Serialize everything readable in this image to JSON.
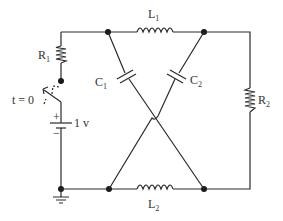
{
  "diagram": {
    "type": "circuit-schematic",
    "components": {
      "R1": {
        "label": "R",
        "sub": "1"
      },
      "R2": {
        "label": "R",
        "sub": "2"
      },
      "L1": {
        "label": "L",
        "sub": "1"
      },
      "L2": {
        "label": "L",
        "sub": "2"
      },
      "C1": {
        "label": "C",
        "sub": "1"
      },
      "C2": {
        "label": "C",
        "sub": "2"
      },
      "switch": {
        "label": "t = 0"
      },
      "battery": {
        "label": "1 v",
        "plus": "+",
        "minus": "−"
      }
    }
  }
}
